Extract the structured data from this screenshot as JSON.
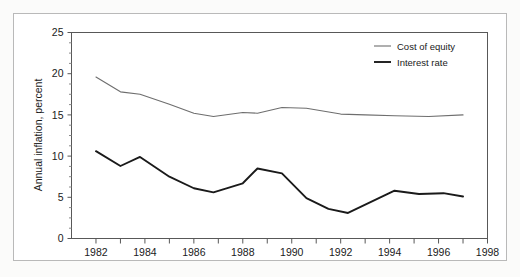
{
  "chart_data": {
    "type": "line",
    "title": "",
    "subtitle": "",
    "xlabel": "",
    "ylabel": "Annual inflation, percent",
    "xlim": [
      1981,
      1998
    ],
    "ylim": [
      0,
      25
    ],
    "grid": false,
    "legend_position": "top-right",
    "y_ticks": [
      0,
      5,
      10,
      15,
      20,
      25
    ],
    "y_tick_labels": [
      "0",
      "5",
      "10",
      "15",
      "20",
      "25"
    ],
    "y_minor_tick_step": 1.25,
    "x_ticks": [
      1981,
      1982,
      1983,
      1984,
      1985,
      1986,
      1987,
      1988,
      1989,
      1990,
      1991,
      1992,
      1993,
      1994,
      1995,
      1996,
      1997,
      1998
    ],
    "x_tick_labels": [
      "1982",
      "1984",
      "1986",
      "1988",
      "1990",
      "1992",
      "1994",
      "1996",
      "1998"
    ],
    "x_labeled_ticks": [
      1982,
      1984,
      1986,
      1988,
      1990,
      1992,
      1994,
      1996,
      1998
    ],
    "series": [
      {
        "name": "Cost of equity",
        "color": "#6e6e6e",
        "width": 1.1,
        "x": [
          1982.0,
          1983.0,
          1983.8,
          1985.0,
          1986.0,
          1986.8,
          1988.0,
          1988.6,
          1989.6,
          1990.6,
          1992.0,
          1993.0,
          1994.2,
          1995.6,
          1997.0
        ],
        "y": [
          19.6,
          17.8,
          17.5,
          16.3,
          15.2,
          14.8,
          15.3,
          15.2,
          15.9,
          15.8,
          15.1,
          15.0,
          14.9,
          14.8,
          15.0
        ]
      },
      {
        "name": "Interest rate",
        "color": "#1a1a1a",
        "width": 1.9,
        "x": [
          1982.0,
          1983.0,
          1983.8,
          1985.0,
          1986.0,
          1986.8,
          1988.0,
          1988.6,
          1989.6,
          1990.6,
          1991.5,
          1992.3,
          1994.2,
          1995.2,
          1996.2,
          1997.0
        ],
        "y": [
          10.6,
          8.8,
          9.9,
          7.5,
          6.1,
          5.6,
          6.7,
          8.5,
          7.9,
          4.9,
          3.6,
          3.1,
          5.8,
          5.4,
          5.5,
          5.1
        ]
      }
    ],
    "annotations": []
  },
  "legend": {
    "entries": [
      {
        "label": "Cost of equity"
      },
      {
        "label": "Interest rate"
      }
    ]
  }
}
